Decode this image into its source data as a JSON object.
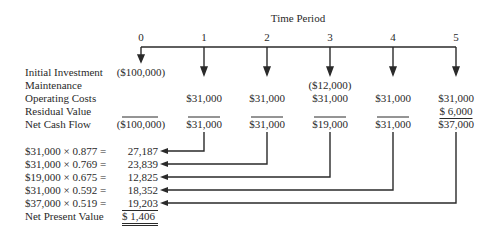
{
  "title": "Time Period",
  "periods": [
    "0",
    "1",
    "2",
    "3",
    "4",
    "5"
  ],
  "rows": [
    {
      "label": "Initial Investment",
      "values": [
        "($100,000)",
        "",
        "",
        "",
        "",
        ""
      ]
    },
    {
      "label": "Maintenance",
      "values": [
        "",
        "",
        "",
        "($12,000)",
        "",
        ""
      ]
    },
    {
      "label": "Operating Costs",
      "values": [
        "",
        "$31,000",
        "$31,000",
        "$31,000",
        "$31,000",
        "$31,000"
      ]
    },
    {
      "label": "Residual Value",
      "values": [
        "",
        "",
        "",
        "",
        "",
        "$ 6,000"
      ]
    },
    {
      "label": "Net Cash Flow",
      "values": [
        "($100,000)",
        "$31,000",
        "$31,000",
        "$19,000",
        "$31,000",
        "$37,000"
      ]
    }
  ],
  "pv_rows": [
    {
      "formula": "$31,000 × 0.877 =",
      "value": "27,187"
    },
    {
      "formula": "$31,000 × 0.769 =",
      "value": "23,839"
    },
    {
      "formula": "$19,000 × 0.675 =",
      "value": "12,825"
    },
    {
      "formula": "$31,000 × 0.592 =",
      "value": "18,352"
    },
    {
      "formula": "$37,000 × 0.519 =",
      "value": "19,203"
    }
  ],
  "npv": {
    "label": "Net Present Value",
    "value": "$ 1,406"
  },
  "colors": {
    "ink": "#2a2a2a",
    "background": "#ffffff"
  }
}
